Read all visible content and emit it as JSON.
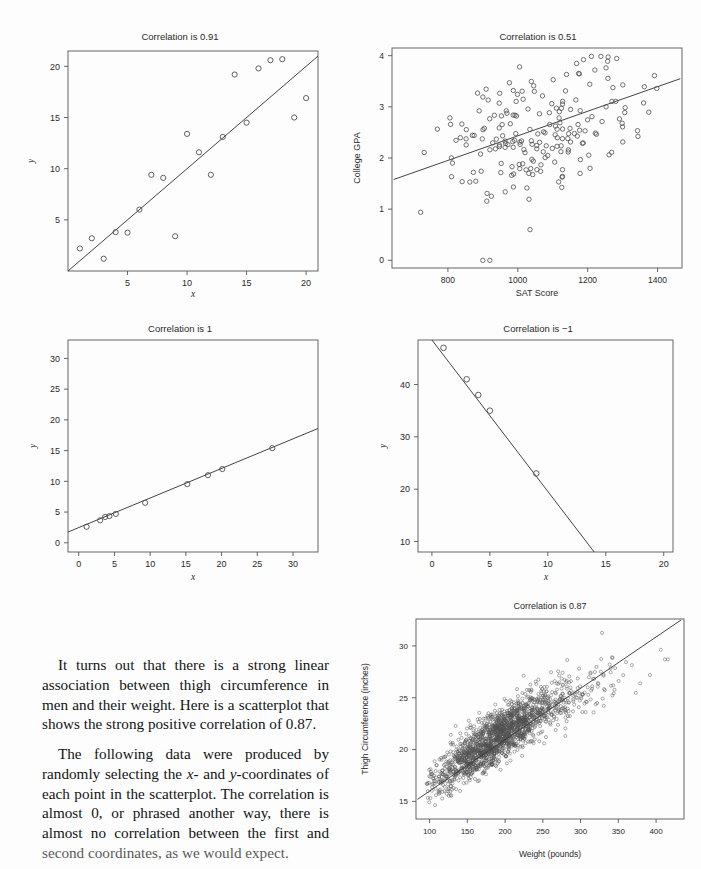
{
  "page": {
    "background": "#fdfdfd",
    "ink": "#1a1a1a",
    "marker_color": "#555555",
    "axis_color": "#4a4a4a"
  },
  "panels": [
    {
      "id": "panel-corr-091",
      "title": "Correlation is 0.91",
      "xlabel": "x",
      "ylabel": "y",
      "xticks": [
        "5",
        "10",
        "15",
        "20"
      ],
      "yticks": [
        "5",
        "10",
        "15",
        "20"
      ]
    },
    {
      "id": "panel-sat-gpa",
      "title": "Correlation is 0.51",
      "xlabel": "SAT Score",
      "ylabel": "College GPA",
      "xticks": [
        "800",
        "1000",
        "1200",
        "1400"
      ],
      "yticks": [
        "0",
        "1",
        "2",
        "3",
        "4"
      ]
    },
    {
      "id": "panel-corr-1",
      "title": "Correlation is 1",
      "xlabel": "x",
      "ylabel": "y",
      "xticks": [
        "0",
        "5",
        "10",
        "15",
        "20",
        "25",
        "30"
      ],
      "yticks": [
        "0",
        "5",
        "10",
        "15",
        "20",
        "25",
        "30"
      ]
    },
    {
      "id": "panel-corr-neg1",
      "title": "Correlation is −1",
      "xlabel": "x",
      "ylabel": "y",
      "xticks": [
        "0",
        "5",
        "10",
        "15",
        "20"
      ],
      "yticks": [
        "10",
        "20",
        "30",
        "40"
      ]
    },
    {
      "id": "panel-thigh-weight",
      "title": "Correlation is 0.87",
      "xlabel": "Weight (pounds)",
      "ylabel": "Thigh Circumference (inches)",
      "xticks": [
        "100",
        "150",
        "200",
        "250",
        "300",
        "350",
        "400"
      ],
      "yticks": [
        "15",
        "20",
        "25",
        "30"
      ]
    }
  ],
  "body_text": {
    "paragraph1_a": "It turns out that there is a strong linear association between thigh circumference in men and their weight. Here is a scatterplot that shows the strong positive correlation of 0.87.",
    "paragraph2_a": "The following data were produced by randomly selecting the ",
    "paragraph2_x": "x",
    "paragraph2_b": "- and ",
    "paragraph2_y": "y",
    "paragraph2_c": "-coordinates of each point in the scatterplot. The correlation is almost 0, or phrased another way, there is almost no correlation between the first and ",
    "paragraph2_d": "second coordinates, as we would expect."
  },
  "chart_data": [
    {
      "type": "scatter",
      "id": "panel-corr-091",
      "title": "Correlation is 0.91",
      "xlabel": "x",
      "ylabel": "y",
      "xlim": [
        0,
        21
      ],
      "ylim": [
        0,
        21.5
      ],
      "xticks": [
        5,
        10,
        15,
        20
      ],
      "yticks": [
        5,
        10,
        15,
        20
      ],
      "grid": false,
      "legend": "none",
      "points": [
        [
          1,
          2.2
        ],
        [
          2,
          3.2
        ],
        [
          3,
          1.2
        ],
        [
          4,
          3.8
        ],
        [
          5,
          3.75
        ],
        [
          6,
          6.0
        ],
        [
          7,
          9.4
        ],
        [
          8,
          9.1
        ],
        [
          9,
          3.4
        ],
        [
          10,
          13.4
        ],
        [
          11,
          11.6
        ],
        [
          12,
          9.4
        ],
        [
          13,
          13.1
        ],
        [
          14,
          19.2
        ],
        [
          15,
          14.5
        ],
        [
          16,
          19.8
        ],
        [
          17,
          20.6
        ],
        [
          18,
          20.7
        ],
        [
          19,
          15.0
        ],
        [
          20,
          16.9
        ]
      ],
      "fit_line": {
        "x": [
          0,
          21
        ],
        "y": [
          0,
          21
        ]
      }
    },
    {
      "type": "scatter",
      "id": "panel-sat-gpa",
      "title": "Correlation is 0.51",
      "xlabel": "SAT Score",
      "ylabel": "College GPA",
      "xlim": [
        640,
        1470
      ],
      "ylim": [
        -0.15,
        4.15
      ],
      "xticks": [
        800,
        1000,
        1200,
        1400
      ],
      "yticks": [
        0,
        1,
        2,
        3,
        4
      ],
      "grid": false,
      "legend": "none",
      "n_points": 200,
      "correlation": 0.51,
      "fit_line": {
        "x": [
          645,
          1465
        ],
        "y": [
          1.58,
          3.55
        ]
      }
    },
    {
      "type": "scatter",
      "id": "panel-corr-1",
      "title": "Correlation is 1",
      "xlabel": "x",
      "ylabel": "y",
      "xlim": [
        -1.5,
        33.5
      ],
      "ylim": [
        -1.5,
        33
      ],
      "xticks": [
        0,
        5,
        10,
        15,
        20,
        25,
        30
      ],
      "yticks": [
        0,
        5,
        10,
        15,
        20,
        25,
        30
      ],
      "grid": false,
      "legend": "none",
      "points": [
        [
          1.1,
          2.6
        ],
        [
          3.0,
          3.65
        ],
        [
          3.7,
          4.2
        ],
        [
          4.3,
          4.35
        ],
        [
          5.2,
          4.7
        ],
        [
          9.3,
          6.5
        ],
        [
          15.2,
          9.55
        ],
        [
          18.1,
          11.0
        ],
        [
          20.1,
          12.0
        ],
        [
          27.1,
          15.4
        ]
      ],
      "correlation": 1,
      "fit_line": {
        "x": [
          -1.5,
          33.5
        ],
        "y": [
          1.75,
          18.6
        ]
      }
    },
    {
      "type": "scatter",
      "id": "panel-corr-neg1",
      "title": "Correlation is −1",
      "xlabel": "x",
      "ylabel": "y",
      "xlim": [
        -1.2,
        20.8
      ],
      "ylim": [
        8.0,
        48.5
      ],
      "xticks": [
        0,
        5,
        10,
        15,
        20
      ],
      "yticks": [
        10,
        20,
        30,
        40
      ],
      "grid": false,
      "legend": "none",
      "points": [
        [
          1,
          47
        ],
        [
          3,
          41
        ],
        [
          4,
          38
        ],
        [
          5,
          35
        ],
        [
          9,
          23
        ]
      ],
      "correlation": -1,
      "fit_line": {
        "x": [
          0.0,
          14.0
        ],
        "y": [
          48.5,
          8.0
        ]
      }
    },
    {
      "type": "scatter",
      "id": "panel-thigh-weight",
      "title": "Correlation is 0.87",
      "xlabel": "Weight (pounds)",
      "ylabel": "Thigh Circumference (inches)",
      "xlim": [
        82,
        437
      ],
      "ylim": [
        13.3,
        32.6
      ],
      "xticks": [
        100,
        150,
        200,
        250,
        300,
        350,
        400
      ],
      "yticks": [
        15,
        20,
        25,
        30
      ],
      "grid": false,
      "legend": "none",
      "n_points": 1800,
      "correlation": 0.87,
      "fit_line": {
        "x": [
          84,
          433
        ],
        "y": [
          15.2,
          32.5
        ]
      }
    }
  ]
}
